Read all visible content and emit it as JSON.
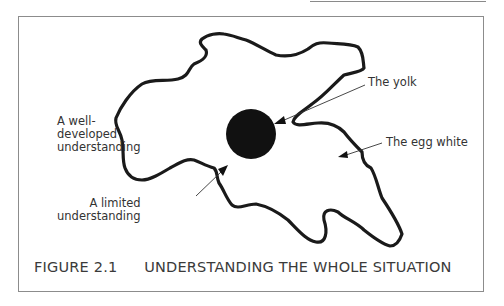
{
  "figure": {
    "number": "FIGURE 2.1",
    "title": "UNDERSTANDING THE WHOLE SITUATION"
  },
  "labels": {
    "yolk": "The yolk",
    "egg_white": "The egg white",
    "well_developed": [
      "A well-",
      "developed",
      "understanding"
    ],
    "limited": [
      "A limited",
      "understanding"
    ]
  },
  "diagram": {
    "outline_color": "#1a1a1a",
    "yolk_color": "#111111",
    "yolk_center": [
      251,
      134
    ],
    "yolk_radius": 25,
    "frame_color": "#8c8c8c"
  }
}
